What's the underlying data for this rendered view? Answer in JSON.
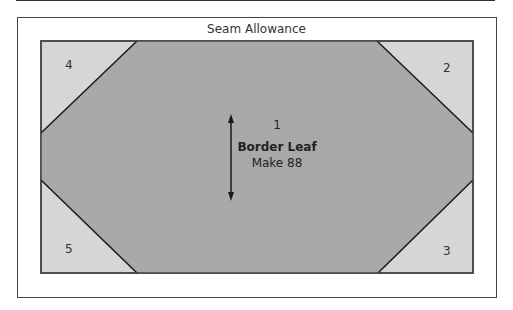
{
  "title": "Seam Allowance",
  "block": {
    "name": "Border Leaf",
    "quantity": "Make 88",
    "pieces": [
      {
        "id": "1",
        "label": "1"
      },
      {
        "id": "2",
        "label": "2"
      },
      {
        "id": "3",
        "label": "3"
      },
      {
        "id": "4",
        "label": "4"
      },
      {
        "id": "5",
        "label": "5"
      }
    ]
  },
  "colors": {
    "center": "#a9a9a9",
    "corner": "#d6d6d6",
    "line": "#1a1a1a"
  }
}
